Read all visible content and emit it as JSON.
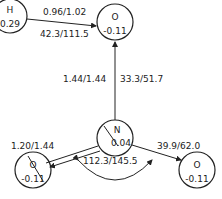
{
  "atoms": {
    "h": {
      "symbol": "H",
      "charge": "0.29"
    },
    "o_top": {
      "symbol": "O",
      "charge": "-0.11"
    },
    "n": {
      "symbol": "N",
      "charge": "0.04"
    },
    "o_left": {
      "symbol": "O",
      "charge": "-0.11"
    },
    "o_right": {
      "symbol": "O",
      "charge": "-0.11"
    }
  },
  "bonds": {
    "h_o_top": "0.96/1.02",
    "h_o_top_2": "42.3/111.5",
    "o_n_1": "1.44/1.44",
    "o_n_2": "33.3/51.7",
    "n_o_left": "1.20/1.44",
    "angle": "112.3/145.5",
    "n_o_right": "39.9/62.0"
  },
  "colors": {
    "stroke": "#222222",
    "background": "#ffffff"
  }
}
